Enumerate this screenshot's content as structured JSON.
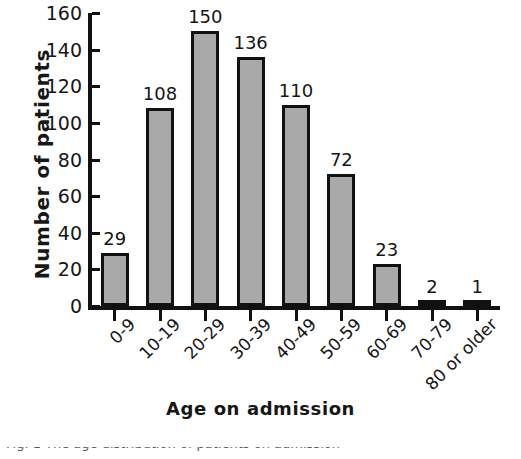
{
  "chart_data": {
    "type": "bar",
    "title": "",
    "xlabel": "Age on admission",
    "ylabel": "Number of patients",
    "categories": [
      "0-9",
      "10-19",
      "20-29",
      "30-39",
      "40-49",
      "50-59",
      "60-69",
      "70-79",
      "80 or older"
    ],
    "values": [
      29,
      108,
      150,
      136,
      110,
      72,
      23,
      2,
      1
    ],
    "value_labels": [
      "29",
      "108",
      "150",
      "136",
      "110",
      "72",
      "23",
      "2",
      "1"
    ],
    "ylim": [
      0,
      160
    ],
    "yticks": [
      0,
      20,
      40,
      60,
      80,
      100,
      120,
      140,
      160
    ],
    "ytick_labels": [
      "0",
      "20",
      "40",
      "60",
      "80",
      "100",
      "120",
      "140",
      "160"
    ],
    "grid": false,
    "legend": false,
    "legend_position": "none",
    "bar_fill_color": "#a9a9a9",
    "bar_edge_color": "#111111",
    "axis_color": "#111111",
    "xtick_label_rotation": -45
  },
  "caption": {
    "text": "Fig. 1  The age distribution of patients on admission"
  }
}
